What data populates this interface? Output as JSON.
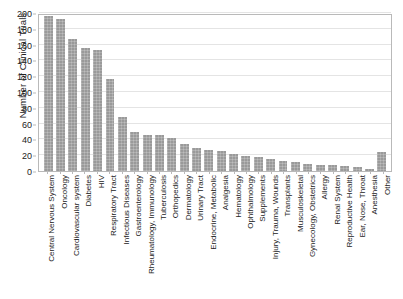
{
  "chart_data": {
    "type": "bar",
    "title": "",
    "xlabel": "",
    "ylabel": "Number of Clinical Trials",
    "ylim": [
      0,
      200
    ],
    "yticks": [
      0,
      20,
      40,
      60,
      80,
      100,
      120,
      140,
      160,
      180,
      200
    ],
    "grid": true,
    "legend": false,
    "bar_color": "#9a9a9a",
    "categories": [
      "Central Nervous System",
      "Oncology",
      "Cardiovascular system",
      "Diabetes",
      "HIV",
      "Respiratory Tract",
      "Infectious Diseases",
      "Gastroenterology",
      "Rheumatology, Immunology",
      "Tuberculosis",
      "Orthopedics",
      "Dermatology",
      "Urinary Tract",
      "Endocrine, Metabolic",
      "Analgesia",
      "Hematology",
      "Ophthalmology",
      "Supplements",
      "Injury, Trauma, Wounds",
      "Transplants",
      "Musculoskeletal",
      "Gynecology, Obstetrics",
      "Allergy",
      "Renal System",
      "Reproductive Health",
      "Ear, Nose, Throat",
      "Anesthesia",
      "Other"
    ],
    "values": [
      196,
      192,
      167,
      156,
      153,
      117,
      68,
      49,
      46,
      45,
      42,
      34,
      29,
      27,
      25,
      21,
      19,
      18,
      15,
      13,
      11,
      9,
      8,
      7,
      6,
      5,
      3,
      24
    ]
  }
}
